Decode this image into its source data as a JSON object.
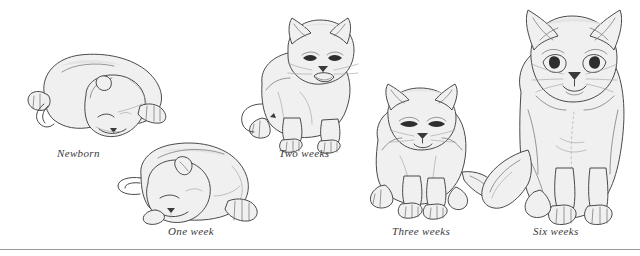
{
  "figure": {
    "background_color": "#ffffff",
    "line_color": "#4a4a4a",
    "fill_color": "#f0f0f0",
    "shading_color": "#e2e2e2",
    "caption_color": "#3a3a3a",
    "rule_color": "#9a9a9a"
  },
  "stages": [
    {
      "id": "newborn",
      "label": "Newborn",
      "pose": "curled asleep, head tucked down, eyes closed",
      "eyes": "closed"
    },
    {
      "id": "one-week",
      "label": "One week",
      "pose": "curled asleep on side, head to the left, eyes closed",
      "eyes": "closed"
    },
    {
      "id": "two-weeks",
      "label": "Two weeks",
      "pose": "sitting upright facing viewer, mouth open",
      "eyes": "open"
    },
    {
      "id": "three-weeks",
      "label": "Three weeks",
      "pose": "standing crouched facing viewer, tail out to the right",
      "eyes": "open"
    },
    {
      "id": "six-weeks",
      "label": "Six weeks",
      "pose": "sitting tall facing viewer, tail curled to the left",
      "eyes": "open"
    }
  ]
}
